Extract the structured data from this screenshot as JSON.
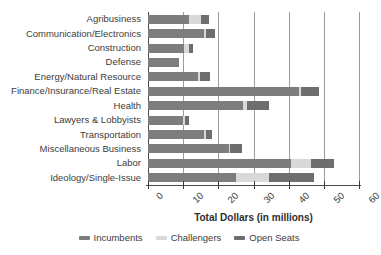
{
  "chart_data": {
    "type": "bar",
    "orientation": "horizontal",
    "stacked": true,
    "title": "",
    "xlabel": "Total Dollars (in millions)",
    "ylabel": "",
    "xlim": [
      0,
      60
    ],
    "xticks": [
      0,
      10,
      20,
      30,
      40,
      50,
      60
    ],
    "xticklabels": [
      "0",
      "10",
      "20",
      "30",
      "40",
      "50",
      "60"
    ],
    "grid": "vertical",
    "legend_position": "bottom",
    "categories": [
      "Agribusiness",
      "Communication/Electronics",
      "Construction",
      "Defense",
      "Energy/Natural Resource",
      "Finance/Insurance/Real Estate",
      "Health",
      "Lawyers & Lobbyists",
      "Transportation",
      "Miscellaneous Business",
      "Labor",
      "Ideology/Single-Issue"
    ],
    "series": [
      {
        "name": "Incumbents",
        "color": "#7d7d7d",
        "values": [
          11.7,
          16.0,
          10.3,
          8.8,
          14.2,
          43.0,
          27.1,
          10.0,
          16.0,
          23.1,
          40.7,
          25.1
        ]
      },
      {
        "name": "Challengers",
        "color": "#d9d9d9",
        "values": [
          3.4,
          0.6,
          1.4,
          0.0,
          0.5,
          0.6,
          1.1,
          0.6,
          0.4,
          0.3,
          5.7,
          9.4
        ]
      },
      {
        "name": "Open Seats",
        "color": "#6e6e6e",
        "values": [
          2.3,
          2.5,
          1.1,
          0.0,
          2.9,
          5.1,
          6.3,
          1.1,
          1.9,
          3.4,
          6.6,
          12.8
        ]
      }
    ],
    "totals": [
      17.4,
      19.1,
      12.8,
      8.8,
      17.6,
      48.7,
      34.5,
      11.7,
      18.3,
      26.8,
      53.0,
      47.3
    ]
  },
  "legend": {
    "items": [
      {
        "label": "Incumbents",
        "color": "#7d7d7d",
        "icon": "legend-swatch-icon"
      },
      {
        "label": "Challengers",
        "color": "#d9d9d9",
        "icon": "legend-swatch-icon"
      },
      {
        "label": "Open Seats",
        "color": "#6e6e6e",
        "icon": "legend-swatch-icon"
      }
    ]
  },
  "axis": {
    "x_title": "Total Dollars (in millions)"
  }
}
